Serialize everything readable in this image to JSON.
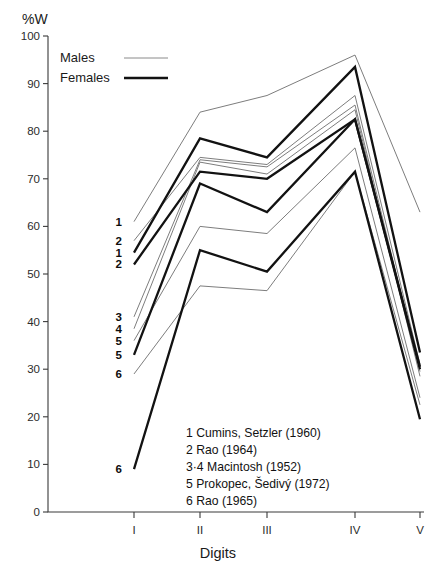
{
  "figure": {
    "y_axis_title": "%W",
    "x_axis_title": "Digits"
  },
  "legend": {
    "position": "top-left",
    "entries": [
      {
        "label": "Males",
        "style": "thin-line",
        "color": "#7d7d7d"
      },
      {
        "label": "Females",
        "style": "thick-line",
        "color": "#121212"
      }
    ]
  },
  "notes": {
    "title": "",
    "items": [
      "1  Cumins, Setzler (1960)",
      "2  Rao (1964)",
      "3·4 Macintosh (1952)",
      "5  Prokopec, Šedivý (1972)",
      "6  Rao (1965)"
    ]
  },
  "point_labels": [
    {
      "text": "1",
      "digit": "I",
      "value": 61
    },
    {
      "text": "2",
      "digit": "I",
      "value": 57
    },
    {
      "text": "1",
      "digit": "I",
      "value": 54.5
    },
    {
      "text": "2",
      "digit": "I",
      "value": 52
    },
    {
      "text": "3",
      "digit": "I",
      "value": 41
    },
    {
      "text": "4",
      "digit": "I",
      "value": 38.5
    },
    {
      "text": "5",
      "digit": "I",
      "value": 36
    },
    {
      "text": "5",
      "digit": "I",
      "value": 33
    },
    {
      "text": "6",
      "digit": "I",
      "value": 29
    },
    {
      "text": "6",
      "digit": "I",
      "value": 9
    }
  ],
  "chart_data": {
    "type": "line",
    "title": "",
    "subtitle": "",
    "xlabel": "Digits",
    "ylabel": "%W",
    "categories": [
      "I",
      "II",
      "III",
      "IV",
      "V"
    ],
    "x": [
      1,
      2,
      3,
      4,
      5
    ],
    "ylim": [
      0,
      100
    ],
    "xlim": [
      0.55,
      5.35
    ],
    "y_ticks": [
      0,
      10,
      20,
      30,
      40,
      50,
      60,
      70,
      80,
      90,
      100
    ],
    "x_ticks": [
      "I",
      "II",
      "III",
      "IV",
      "V"
    ],
    "grid": false,
    "legend_position": "top-left",
    "annotations": [
      "1  Cumins, Setzler (1960)",
      "2  Rao (1964)",
      "3·4 Macintosh (1952)",
      "5  Prokopec, Šedivý (1972)",
      "6  Rao (1965)"
    ],
    "series": [
      {
        "name": "1 Cumins, Setzler (1960) Males",
        "sex": "Males",
        "ref": 1,
        "style": "thin",
        "values": [
          61,
          84,
          87.5,
          96,
          63
        ]
      },
      {
        "name": "2 Rao (1964) Males",
        "sex": "Males",
        "ref": 2,
        "style": "thin",
        "values": [
          57,
          74.5,
          73,
          87.5,
          31
        ]
      },
      {
        "name": "3 Macintosh (1952) Males",
        "sex": "Males",
        "ref": 3,
        "style": "thin",
        "values": [
          41,
          74,
          72.5,
          85.5,
          29.5
        ]
      },
      {
        "name": "4 Macintosh (1952) Males",
        "sex": "Males",
        "ref": 4,
        "style": "thin",
        "values": [
          38.5,
          73.5,
          71,
          84.5,
          28.5
        ]
      },
      {
        "name": "5 Prokopec, Šedivý (1972) Males",
        "sex": "Males",
        "ref": 5,
        "style": "thin",
        "values": [
          36,
          60,
          58.5,
          76.5,
          24
        ]
      },
      {
        "name": "6 Rao (1965) Males",
        "sex": "Males",
        "ref": 6,
        "style": "thin",
        "values": [
          29,
          47.5,
          46.5,
          71.5,
          22.5
        ]
      },
      {
        "name": "1 Cumins, Setzler (1960) Females",
        "sex": "Females",
        "ref": 1,
        "style": "thick",
        "values": [
          54.5,
          78.5,
          74.5,
          93.5,
          33.5
        ]
      },
      {
        "name": "2 Rao (1964) Females",
        "sex": "Females",
        "ref": 2,
        "style": "thick",
        "values": [
          52,
          71.5,
          70,
          82.5,
          30.5
        ]
      },
      {
        "name": "5 Prokopec, Šedivý (1972) Females",
        "sex": "Females",
        "ref": 5,
        "style": "thick",
        "values": [
          33,
          69,
          63,
          82.5,
          30
        ]
      },
      {
        "name": "6 Rao (1965) Females",
        "sex": "Females",
        "ref": 6,
        "style": "thick",
        "values": [
          9,
          55,
          50.5,
          71.5,
          19.5
        ]
      }
    ]
  }
}
